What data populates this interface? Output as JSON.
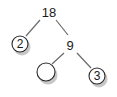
{
  "diagram": {
    "type": "factor-tree",
    "nodes": [
      {
        "id": "n18",
        "label": "18",
        "circled": false
      },
      {
        "id": "n2",
        "label": "2",
        "circled": true
      },
      {
        "id": "n9",
        "label": "9",
        "circled": false
      },
      {
        "id": "nblank",
        "label": "",
        "circled": true
      },
      {
        "id": "n3",
        "label": "3",
        "circled": true
      }
    ],
    "edges": [
      {
        "from": "n18",
        "to": "n2"
      },
      {
        "from": "n18",
        "to": "n9"
      },
      {
        "from": "n9",
        "to": "nblank"
      },
      {
        "from": "n9",
        "to": "n3"
      }
    ]
  }
}
